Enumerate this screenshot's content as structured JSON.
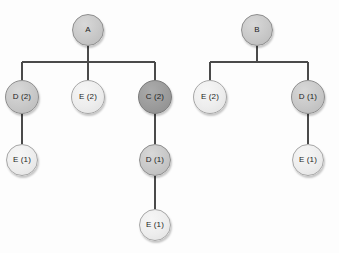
{
  "diagram": {
    "background_color": "#fdfdfd",
    "edge_color": "#4a4a4a",
    "node_tones": {
      "mid": "#c9c9c9",
      "light": "#ededed",
      "dark": "#9c9c9c"
    },
    "trees": [
      {
        "name": "tree-a",
        "root": "A",
        "nodes": [
          {
            "id": "a-root",
            "label": "A",
            "cx": 88,
            "cy": 30,
            "r": 16,
            "tone": "mid",
            "level": 0
          },
          {
            "id": "a-d2",
            "label": "D (2)",
            "cx": 22,
            "cy": 97,
            "r": 17,
            "tone": "mid",
            "level": 1
          },
          {
            "id": "a-e2",
            "label": "E (2)",
            "cx": 88,
            "cy": 97,
            "r": 17,
            "tone": "light",
            "level": 1
          },
          {
            "id": "a-c2",
            "label": "C (2)",
            "cx": 155,
            "cy": 97,
            "r": 17,
            "tone": "dark",
            "level": 1
          },
          {
            "id": "a-d2-e1",
            "label": "E (1)",
            "cx": 22,
            "cy": 160,
            "r": 16,
            "tone": "light",
            "level": 2
          },
          {
            "id": "a-c2-d1",
            "label": "D (1)",
            "cx": 155,
            "cy": 160,
            "r": 16,
            "tone": "mid",
            "level": 2
          },
          {
            "id": "a-c2-d1-e1",
            "label": "E (1)",
            "cx": 155,
            "cy": 225,
            "r": 16,
            "tone": "light",
            "level": 3
          }
        ]
      },
      {
        "name": "tree-b",
        "root": "B",
        "nodes": [
          {
            "id": "b-root",
            "label": "B",
            "cx": 257,
            "cy": 30,
            "r": 16,
            "tone": "mid",
            "level": 0
          },
          {
            "id": "b-e2",
            "label": "E (2)",
            "cx": 210,
            "cy": 97,
            "r": 17,
            "tone": "light",
            "level": 1
          },
          {
            "id": "b-d1",
            "label": "D (1)",
            "cx": 308,
            "cy": 97,
            "r": 17,
            "tone": "mid",
            "level": 1
          },
          {
            "id": "b-d1-e1",
            "label": "E (1)",
            "cx": 308,
            "cy": 160,
            "r": 16,
            "tone": "light",
            "level": 2
          }
        ]
      }
    ],
    "edges": [
      {
        "from": "a-root",
        "to": "a-d2",
        "bar_y": 62
      },
      {
        "from": "a-root",
        "to": "a-e2",
        "bar_y": 62
      },
      {
        "from": "a-root",
        "to": "a-c2",
        "bar_y": 62
      },
      {
        "from": "a-d2",
        "to": "a-d2-e1",
        "bar_y": null
      },
      {
        "from": "a-c2",
        "to": "a-c2-d1",
        "bar_y": null
      },
      {
        "from": "a-c2-d1",
        "to": "a-c2-d1-e1",
        "bar_y": null
      },
      {
        "from": "b-root",
        "to": "b-e2",
        "bar_y": 62
      },
      {
        "from": "b-root",
        "to": "b-d1",
        "bar_y": 62
      },
      {
        "from": "b-d1",
        "to": "b-d1-e1",
        "bar_y": null
      }
    ]
  }
}
